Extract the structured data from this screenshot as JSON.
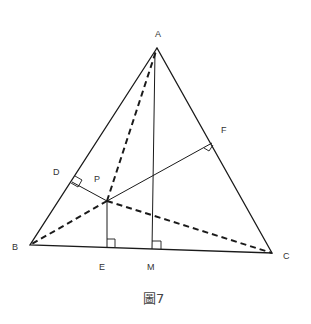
{
  "figure": {
    "caption": "圖7",
    "points": {
      "A": {
        "label": "A",
        "x": 157,
        "y": 48
      },
      "B": {
        "label": "B",
        "x": 30,
        "y": 245
      },
      "C": {
        "label": "C",
        "x": 272,
        "y": 253
      },
      "P": {
        "label": "P",
        "x": 107,
        "y": 201
      },
      "D": {
        "label": "D",
        "x": 72,
        "y": 182
      },
      "F": {
        "label": "F",
        "x": 212,
        "y": 143
      },
      "E": {
        "label": "E",
        "x": 107,
        "y": 247
      },
      "M": {
        "label": "M",
        "x": 152,
        "y": 249
      }
    },
    "solid_segments": [
      "AB",
      "BC",
      "CA",
      "PD",
      "PF",
      "PE",
      "AM"
    ],
    "dashed_segments": [
      "PA",
      "PB",
      "PC"
    ],
    "right_angles": [
      "D",
      "F",
      "E",
      "M"
    ],
    "line_color": "#1a1a1a"
  }
}
